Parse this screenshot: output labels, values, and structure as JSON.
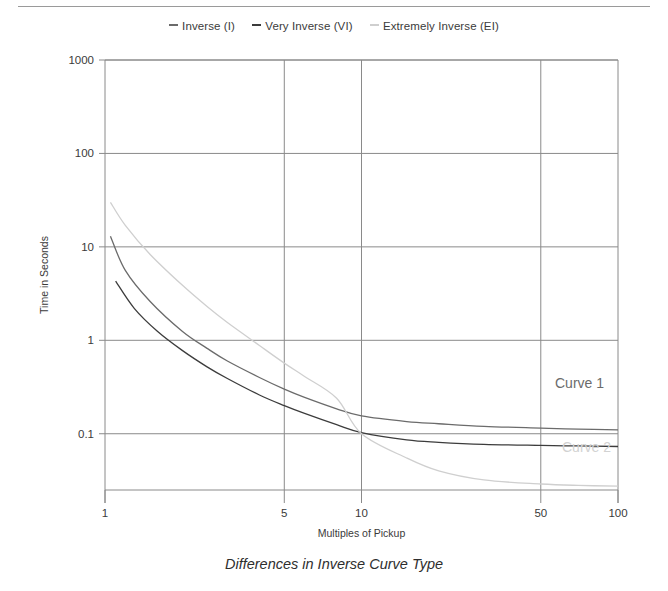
{
  "caption": "Differences in Inverse Curve Type",
  "colors": {
    "inverse": "#6b6b6b",
    "very_inverse": "#3c3c3c",
    "extremely_inverse": "#cfcfcf",
    "axis": "#8a8a8a",
    "grid": "#8a8a8a",
    "text": "#3a3a3a",
    "rule": "#9a9a9a",
    "curve1_label": "#6b6b6b",
    "curve2_label": "#d2d2d2"
  },
  "legend": {
    "items": [
      {
        "label": "Inverse (I)",
        "color": "#6b6b6b"
      },
      {
        "label": "Very Inverse (VI)",
        "color": "#3c3c3c"
      },
      {
        "label": "Extremely Inverse (EI)",
        "color": "#cfcfcf"
      }
    ]
  },
  "annotations": [
    {
      "text": "Curve 1",
      "color": "#6b6b6b"
    },
    {
      "text": "Curve 2",
      "color": "#d2d2d2"
    }
  ],
  "chart_data": {
    "type": "line",
    "title": "Differences in Inverse Curve Type",
    "xlabel": "Multiples of Pickup",
    "ylabel": "Time in Seconds",
    "xscale": "log",
    "yscale": "log",
    "xlim": [
      1,
      100
    ],
    "ylim": [
      0.025,
      1000
    ],
    "xticks": [
      1,
      5,
      10,
      50,
      100
    ],
    "xticklabels": [
      "1",
      "5",
      "10",
      "50",
      "100"
    ],
    "yticks": [
      0.1,
      1,
      10,
      100,
      1000
    ],
    "yticklabels": [
      "0.1",
      "1",
      "10",
      "100",
      "1000"
    ],
    "grid": true,
    "legend_position": "top-center",
    "series": [
      {
        "name": "Inverse (I)",
        "color": "#6b6b6b",
        "label_on_plot": "Curve 1",
        "x": [
          1.05,
          1.2,
          1.5,
          2,
          2.5,
          3,
          4,
          5,
          6,
          8,
          10,
          15,
          20,
          30,
          50,
          70,
          100
        ],
        "y": [
          13.0,
          5.6,
          2.6,
          1.25,
          0.82,
          0.6,
          0.4,
          0.3,
          0.245,
          0.185,
          0.155,
          0.135,
          0.128,
          0.12,
          0.115,
          0.112,
          0.11
        ]
      },
      {
        "name": "Very Inverse (VI)",
        "color": "#3c3c3c",
        "x": [
          1.1,
          1.3,
          1.6,
          2,
          2.5,
          3,
          4,
          5,
          6,
          8,
          10,
          15,
          20,
          30,
          50,
          70,
          100
        ],
        "y": [
          4.3,
          2.2,
          1.25,
          0.78,
          0.52,
          0.39,
          0.26,
          0.2,
          0.165,
          0.125,
          0.103,
          0.086,
          0.081,
          0.077,
          0.075,
          0.074,
          0.073
        ]
      },
      {
        "name": "Extremely Inverse (EI)",
        "color": "#cfcfcf",
        "label_on_plot": "Curve 2",
        "x": [
          1.05,
          1.2,
          1.5,
          2,
          2.5,
          3,
          4,
          5,
          6,
          8,
          10,
          15,
          20,
          30,
          50,
          70,
          100
        ],
        "y": [
          30.0,
          17.0,
          8.3,
          3.9,
          2.3,
          1.55,
          0.88,
          0.57,
          0.41,
          0.24,
          0.1,
          0.055,
          0.04,
          0.032,
          0.029,
          0.028,
          0.0275
        ]
      }
    ]
  }
}
